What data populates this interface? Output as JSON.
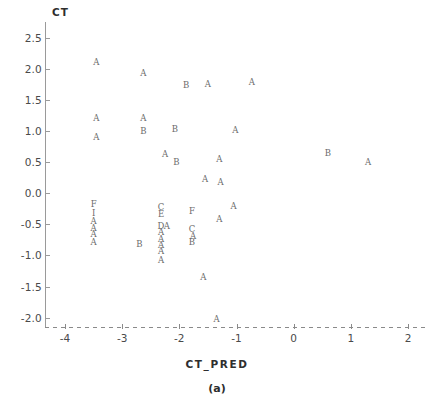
{
  "chart_data": {
    "type": "scatter",
    "title": "",
    "xlabel": "CT_PRED",
    "ylabel": "CT",
    "caption": "(a)",
    "xlim": [
      -4.35,
      2.35
    ],
    "ylim": [
      -2.15,
      2.75
    ],
    "xticks": [
      -4,
      -3,
      -2,
      -1,
      0,
      1,
      2
    ],
    "xticklabels": [
      "-4",
      "-3",
      "-2",
      "-1",
      "0",
      "1",
      "2"
    ],
    "yticks": [
      -2.0,
      -1.5,
      -1.0,
      -0.5,
      0.0,
      0.5,
      1.0,
      1.5,
      2.0,
      2.5
    ],
    "yticklabels": [
      "-2.0",
      "-1.5",
      "-1.0",
      "-0.5",
      "0.0",
      "0.5",
      "1.0",
      "1.5",
      "2.0",
      "2.5"
    ],
    "grid": false,
    "legend": false,
    "xaxis_style": "dashed",
    "yaxis_style": "solid",
    "marker_style": "letter-label",
    "point_color": "#6b6b6b",
    "axis_color": "#9a9a9a",
    "points": [
      {
        "x": -3.45,
        "y": 2.1,
        "label": "A"
      },
      {
        "x": -2.63,
        "y": 1.93,
        "label": "A"
      },
      {
        "x": -1.88,
        "y": 1.73,
        "label": "B"
      },
      {
        "x": -1.5,
        "y": 1.75,
        "label": "A"
      },
      {
        "x": -0.73,
        "y": 1.78,
        "label": "A"
      },
      {
        "x": -3.45,
        "y": 1.2,
        "label": "A"
      },
      {
        "x": -2.63,
        "y": 1.2,
        "label": "A"
      },
      {
        "x": -2.63,
        "y": 1.0,
        "label": "B"
      },
      {
        "x": -2.08,
        "y": 1.03,
        "label": "B"
      },
      {
        "x": -1.02,
        "y": 1.02,
        "label": "A"
      },
      {
        "x": -3.45,
        "y": 0.9,
        "label": "A"
      },
      {
        "x": -2.25,
        "y": 0.63,
        "label": "A"
      },
      {
        "x": -2.05,
        "y": 0.5,
        "label": "B"
      },
      {
        "x": -1.3,
        "y": 0.55,
        "label": "A"
      },
      {
        "x": 0.6,
        "y": 0.65,
        "label": "B"
      },
      {
        "x": 1.3,
        "y": 0.5,
        "label": "A"
      },
      {
        "x": -1.55,
        "y": 0.22,
        "label": "A"
      },
      {
        "x": -1.28,
        "y": 0.18,
        "label": "A"
      },
      {
        "x": -3.5,
        "y": -0.18,
        "label": "F"
      },
      {
        "x": -3.5,
        "y": -0.32,
        "label": "I"
      },
      {
        "x": -2.32,
        "y": -0.22,
        "label": "C"
      },
      {
        "x": -2.32,
        "y": -0.34,
        "label": "E"
      },
      {
        "x": -1.78,
        "y": -0.28,
        "label": "F"
      },
      {
        "x": -1.05,
        "y": -0.2,
        "label": "A"
      },
      {
        "x": -3.5,
        "y": -0.45,
        "label": "A"
      },
      {
        "x": -3.5,
        "y": -0.56,
        "label": "A"
      },
      {
        "x": -3.5,
        "y": -0.66,
        "label": "A"
      },
      {
        "x": -3.5,
        "y": -0.78,
        "label": "A"
      },
      {
        "x": -2.32,
        "y": -0.52,
        "label": "D"
      },
      {
        "x": -2.22,
        "y": -0.52,
        "label": "A"
      },
      {
        "x": -2.32,
        "y": -0.63,
        "label": "A"
      },
      {
        "x": -2.32,
        "y": -0.73,
        "label": "A"
      },
      {
        "x": -2.32,
        "y": -0.83,
        "label": "A"
      },
      {
        "x": -2.32,
        "y": -0.93,
        "label": "A"
      },
      {
        "x": -2.32,
        "y": -1.08,
        "label": "A"
      },
      {
        "x": -2.7,
        "y": -0.82,
        "label": "B"
      },
      {
        "x": -1.78,
        "y": -0.58,
        "label": "C"
      },
      {
        "x": -1.76,
        "y": -0.68,
        "label": "A"
      },
      {
        "x": -1.78,
        "y": -0.78,
        "label": "B"
      },
      {
        "x": -1.3,
        "y": -0.42,
        "label": "A"
      },
      {
        "x": -1.58,
        "y": -1.35,
        "label": "A"
      },
      {
        "x": -1.35,
        "y": -2.02,
        "label": "A"
      }
    ]
  }
}
